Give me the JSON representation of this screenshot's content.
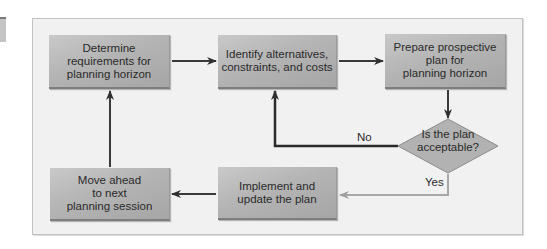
{
  "diagram": {
    "type": "flowchart",
    "nodes": {
      "determine": {
        "label": "Determine\nrequirements for\nplanning horizon"
      },
      "identify": {
        "label": "Identify alternatives,\nconstraints, and costs"
      },
      "prepare": {
        "label": "Prepare prospective\nplan for\nplanning horizon"
      },
      "decision": {
        "label": "Is the plan\nacceptable?"
      },
      "implement": {
        "label": "Implement and\nupdate the plan"
      },
      "move_ahead": {
        "label": "Move ahead\nto next\nplanning session"
      }
    },
    "edge_labels": {
      "no": "No",
      "yes": "Yes"
    },
    "edges": [
      {
        "from": "determine",
        "to": "identify"
      },
      {
        "from": "identify",
        "to": "prepare"
      },
      {
        "from": "prepare",
        "to": "decision"
      },
      {
        "from": "decision",
        "to": "identify",
        "label": "No"
      },
      {
        "from": "decision",
        "to": "implement",
        "label": "Yes"
      },
      {
        "from": "implement",
        "to": "move_ahead"
      },
      {
        "from": "move_ahead",
        "to": "determine"
      }
    ],
    "colors": {
      "panel_bg": "#f1f1f1",
      "box_fill": "#b4b4b4",
      "arrow_dark": "#3a3a3a",
      "arrow_light": "#a8a8a8",
      "diamond_fill": "#b0b0b0"
    }
  }
}
